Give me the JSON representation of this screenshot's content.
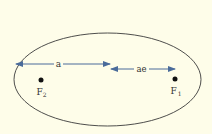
{
  "diagram": {
    "title": "",
    "background": "#fefde9",
    "ellipse": {
      "cx": 107.5,
      "cy": 79.5,
      "rx": 93.5,
      "ry": 46.5,
      "stroke": "#3a3a3a"
    },
    "arrow_color": "#4a6b9a",
    "arrows": [
      {
        "label": "a",
        "x1": 16,
        "x2": 110,
        "y": 64
      },
      {
        "label": "ae",
        "x1": 110,
        "x2": 175,
        "y": 69
      }
    ],
    "foci": [
      {
        "label": "F",
        "sub": "2",
        "x": 41,
        "y": 80
      },
      {
        "label": "F",
        "sub": "1",
        "x": 175,
        "y": 79
      }
    ]
  }
}
